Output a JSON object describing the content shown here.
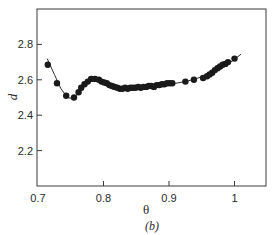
{
  "chart_data": {
    "type": "scatter",
    "title": "",
    "panel_label": "(b)",
    "xlabel": "θ",
    "ylabel": "d",
    "xlim": [
      0.7,
      1.05
    ],
    "ylim": [
      2.0,
      3.0
    ],
    "xticks": [
      0.7,
      0.8,
      0.9,
      1.0
    ],
    "xtick_labels": [
      "0.7",
      "0.8",
      "0.9",
      "1"
    ],
    "yticks": [
      2.2,
      2.4,
      2.6,
      2.8
    ],
    "ytick_labels": [
      "2.2",
      "2.4",
      "2.6",
      "2.8"
    ],
    "grid": false,
    "legend": "none",
    "series": [
      {
        "name": "measured",
        "marker": "filled-circle",
        "color": "#1a1a1a",
        "x": [
          0.715,
          0.729,
          0.743,
          0.755,
          0.762,
          0.766,
          0.771,
          0.776,
          0.781,
          0.787,
          0.793,
          0.797,
          0.801,
          0.805,
          0.809,
          0.813,
          0.817,
          0.821,
          0.825,
          0.829,
          0.833,
          0.837,
          0.841,
          0.845,
          0.849,
          0.853,
          0.857,
          0.861,
          0.865,
          0.869,
          0.873,
          0.877,
          0.881,
          0.885,
          0.889,
          0.893,
          0.897,
          0.901,
          0.905,
          0.925,
          0.938,
          0.952,
          0.958,
          0.962,
          0.966,
          0.97,
          0.974,
          0.978,
          0.982,
          0.986,
          0.99,
          1.0
        ],
        "y": [
          2.685,
          2.58,
          2.51,
          2.5,
          2.53,
          2.555,
          2.575,
          2.59,
          2.605,
          2.605,
          2.6,
          2.59,
          2.585,
          2.58,
          2.57,
          2.565,
          2.56,
          2.555,
          2.55,
          2.55,
          2.555,
          2.55,
          2.555,
          2.555,
          2.555,
          2.56,
          2.555,
          2.56,
          2.56,
          2.565,
          2.565,
          2.56,
          2.57,
          2.57,
          2.575,
          2.575,
          2.58,
          2.58,
          2.58,
          2.59,
          2.6,
          2.61,
          2.62,
          2.63,
          2.64,
          2.655,
          2.665,
          2.675,
          2.685,
          2.69,
          2.7,
          2.72
        ]
      },
      {
        "name": "fit",
        "style": "line",
        "color": "#1a1a1a",
        "x": [
          0.714,
          0.725,
          0.735,
          0.745,
          0.752,
          0.758,
          0.764,
          0.77,
          0.776,
          0.782,
          0.788,
          0.794,
          0.8,
          0.81,
          0.82,
          0.83,
          0.84,
          0.85,
          0.86,
          0.87,
          0.88,
          0.89,
          0.9,
          0.91,
          0.92,
          0.93,
          0.94,
          0.95,
          0.96,
          0.97,
          0.98,
          0.99,
          1.0,
          1.01
        ],
        "y": [
          2.72,
          2.63,
          2.55,
          2.5,
          2.495,
          2.51,
          2.54,
          2.57,
          2.595,
          2.605,
          2.6,
          2.59,
          2.58,
          2.565,
          2.555,
          2.55,
          2.55,
          2.553,
          2.556,
          2.56,
          2.565,
          2.57,
          2.575,
          2.58,
          2.587,
          2.595,
          2.605,
          2.617,
          2.63,
          2.648,
          2.668,
          2.69,
          2.715,
          2.745
        ]
      }
    ]
  }
}
